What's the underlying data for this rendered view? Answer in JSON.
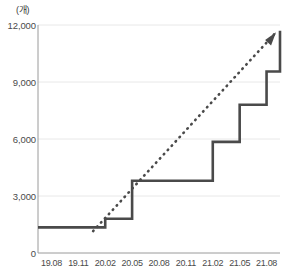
{
  "chart_data": {
    "type": "line",
    "title": "",
    "subtitle": "",
    "xlabel": "",
    "ylabel": "",
    "unit_label": "(개)",
    "ylim": [
      0,
      12000
    ],
    "yticks": [
      0,
      3000,
      6000,
      9000,
      12000
    ],
    "ytick_labels": [
      "0",
      "3,000",
      "6,000",
      "9,000",
      "12,000"
    ],
    "grid": true,
    "grid_axis": "y",
    "legend": false,
    "legend_position": "none",
    "categories": [
      "19.08",
      "19.11",
      "20.02",
      "20.05",
      "20.08",
      "20.11",
      "21.02",
      "21.05",
      "21.08"
    ],
    "x_tick_labels": [
      "19.08",
      "19.11",
      "20.02",
      "20.05",
      "20.08",
      "20.11",
      "21.02",
      "21.05",
      "21.08"
    ],
    "series": [
      {
        "name": "cumulative-count",
        "style": "step",
        "color": "#4a4a4a",
        "x": [
          "19.08",
          "19.11",
          "20.02",
          "20.05",
          "20.08",
          "20.11",
          "21.02",
          "21.05",
          "21.08",
          "21.11"
        ],
        "values": [
          1350,
          1350,
          1800,
          3800,
          3800,
          3800,
          5850,
          7800,
          9550,
          11700
        ]
      },
      {
        "name": "trend-line",
        "style": "dotted-arrow",
        "color": "#4a4a4a",
        "x": [
          "20.02",
          "21.11"
        ],
        "values": [
          1150,
          11500
        ]
      }
    ],
    "annotations": [
      {
        "name": "trend-arrowhead",
        "x": "21.11",
        "y": 11500
      }
    ]
  },
  "colors": {
    "line": "#4a4a4a",
    "grid": "#e8e8e8",
    "axis": "#8c8c8c",
    "text": "#4a4a4a",
    "background": "#ffffff"
  }
}
